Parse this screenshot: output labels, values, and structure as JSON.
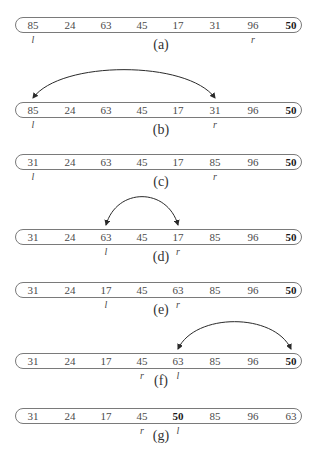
{
  "diagram": {
    "type": "quicksort-partition-steps",
    "pivot_value": "50",
    "column_x": [
      33,
      70,
      106,
      142,
      178,
      215,
      253,
      291
    ],
    "steps": [
      {
        "caption": "(a)",
        "values": [
          "85",
          "24",
          "63",
          "45",
          "17",
          "31",
          "96",
          "50"
        ],
        "bold_index": 7,
        "pointers": [
          {
            "label": "l",
            "index": 0
          },
          {
            "label": "r",
            "index": 6
          }
        ],
        "swap": null
      },
      {
        "caption": "(b)",
        "values": [
          "85",
          "24",
          "63",
          "45",
          "17",
          "31",
          "96",
          "50"
        ],
        "bold_index": 7,
        "pointers": [
          {
            "label": "l",
            "index": 0
          },
          {
            "label": "r",
            "index": 5
          }
        ],
        "swap": [
          0,
          5
        ]
      },
      {
        "caption": "(c)",
        "values": [
          "31",
          "24",
          "63",
          "45",
          "17",
          "85",
          "96",
          "50"
        ],
        "bold_index": 7,
        "pointers": [
          {
            "label": "l",
            "index": 0
          },
          {
            "label": "r",
            "index": 5
          }
        ],
        "swap": null
      },
      {
        "caption": "(d)",
        "values": [
          "31",
          "24",
          "63",
          "45",
          "17",
          "85",
          "96",
          "50"
        ],
        "bold_index": 7,
        "pointers": [
          {
            "label": "l",
            "index": 2
          },
          {
            "label": "r",
            "index": 4
          }
        ],
        "swap": [
          2,
          4
        ]
      },
      {
        "caption": "(e)",
        "values": [
          "31",
          "24",
          "17",
          "45",
          "63",
          "85",
          "96",
          "50"
        ],
        "bold_index": 7,
        "pointers": [
          {
            "label": "l",
            "index": 2
          },
          {
            "label": "r",
            "index": 4
          }
        ],
        "swap": null
      },
      {
        "caption": "(f)",
        "values": [
          "31",
          "24",
          "17",
          "45",
          "63",
          "85",
          "96",
          "50"
        ],
        "bold_index": 7,
        "pointers": [
          {
            "label": "r",
            "index": 3
          },
          {
            "label": "l",
            "index": 4
          }
        ],
        "swap": [
          4,
          7
        ]
      },
      {
        "caption": "(g)",
        "values": [
          "31",
          "24",
          "17",
          "45",
          "50",
          "85",
          "96",
          "63"
        ],
        "bold_index": 4,
        "pointers": [
          {
            "label": "r",
            "index": 3
          },
          {
            "label": "l",
            "index": 4
          }
        ],
        "swap": null
      }
    ]
  },
  "layout": {
    "row_tops": [
      17,
      102,
      154,
      229,
      282,
      353,
      408
    ],
    "caption_tops": [
      38,
      123,
      175,
      250,
      303,
      374,
      429
    ],
    "pointer_offset": 18,
    "arc_peaks": {
      "1": 70,
      "3": 197,
      "5": 322
    }
  },
  "colors": {
    "line": "#7a7a7a",
    "arc": "#2a2a2a",
    "text": "#4a4a4a"
  }
}
